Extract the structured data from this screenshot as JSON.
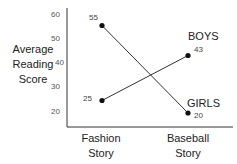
{
  "chart_data": {
    "type": "line",
    "title": "",
    "xlabel": "",
    "ylabel": "Average Reading Score",
    "ylabel_lines": [
      "Average",
      "Reading",
      "Score"
    ],
    "categories": [
      "Fashion Story",
      "Baseball Story"
    ],
    "category_lines": [
      [
        "Fashion",
        "Story"
      ],
      [
        "Baseball",
        "Story"
      ]
    ],
    "series": [
      {
        "name": "BOYS",
        "values": [
          25,
          43
        ]
      },
      {
        "name": "GIRLS",
        "values": [
          55,
          20
        ]
      }
    ],
    "y_ticks": [
      60,
      50,
      40,
      30,
      20
    ],
    "y_tick_labels": [
      "60",
      "50",
      "40",
      "30",
      "20"
    ],
    "ylim": [
      15,
      63
    ],
    "grid": false,
    "legend": "direct labels at line ends",
    "data_labels": {
      "boys": [
        "25",
        "43"
      ],
      "girls": [
        "55",
        "20"
      ]
    },
    "colors": {
      "line": "#333333",
      "marker": "#111111",
      "axis": "#333333"
    }
  }
}
